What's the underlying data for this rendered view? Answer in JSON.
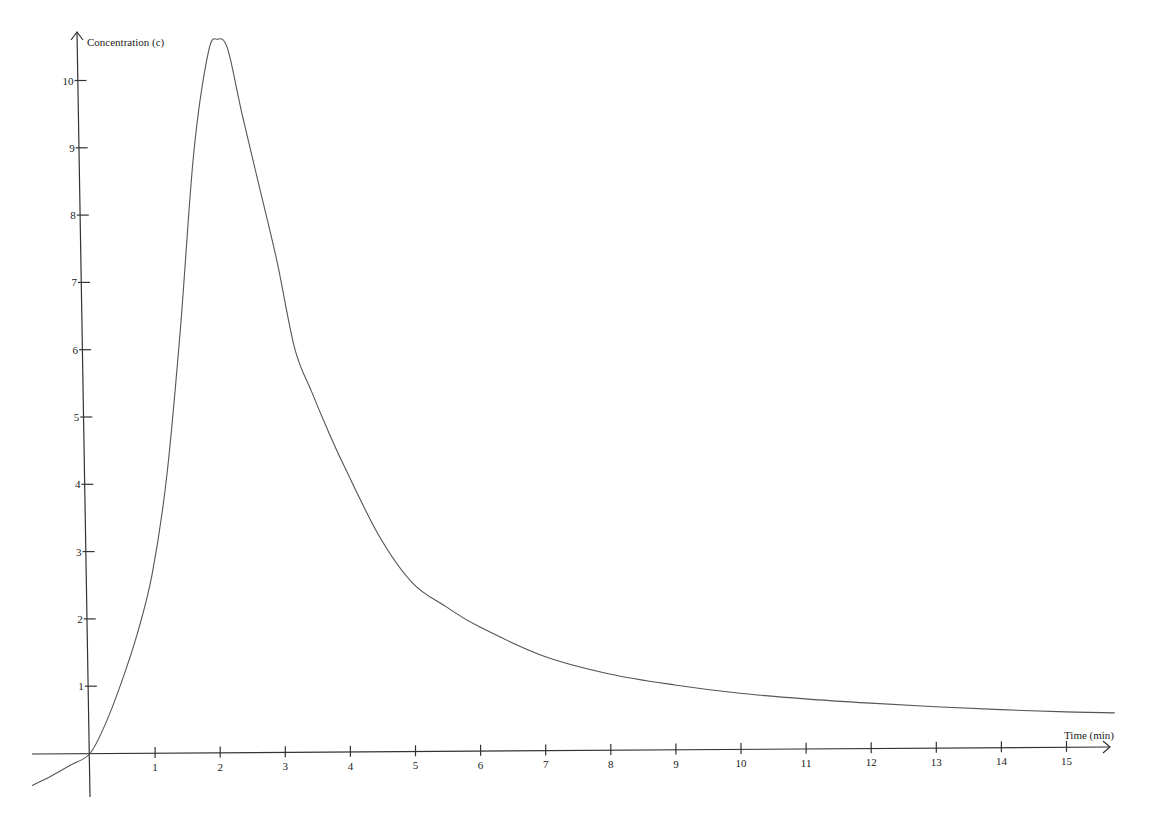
{
  "chart_data": {
    "type": "line",
    "title": "",
    "xlabel": "Time (min)",
    "ylabel": "Concentration (c)",
    "xlim": [
      -0.9,
      15.8
    ],
    "ylim": [
      -0.5,
      10.9
    ],
    "grid": false,
    "legend": "none",
    "x_ticks": [
      1,
      2,
      3,
      4,
      5,
      6,
      7,
      8,
      9,
      10,
      11,
      12,
      13,
      14,
      15
    ],
    "y_ticks": [
      1,
      2,
      3,
      4,
      5,
      6,
      7,
      8,
      9,
      10
    ],
    "series": [
      {
        "name": "c(t)",
        "x": [
          -0.9,
          -0.6,
          -0.3,
          0,
          0.25,
          0.5,
          0.75,
          1.0,
          1.25,
          1.5,
          1.75,
          2.0,
          2.15,
          2.3,
          2.5,
          2.75,
          3.0,
          3.25,
          3.5,
          3.75,
          4.0,
          4.5,
          5.0,
          5.5,
          6.0,
          7.0,
          8.0,
          9.0,
          10.0,
          11.0,
          12.0,
          13.0,
          14.0,
          15.0,
          15.75
        ],
        "values": [
          -0.47,
          -0.33,
          -0.17,
          0,
          0.45,
          1.05,
          1.75,
          2.65,
          4.1,
          6.3,
          8.9,
          10.4,
          10.6,
          10.45,
          9.5,
          8.4,
          7.3,
          6.0,
          5.35,
          4.75,
          4.2,
          3.2,
          2.5,
          2.15,
          1.85,
          1.4,
          1.13,
          0.96,
          0.83,
          0.74,
          0.67,
          0.61,
          0.56,
          0.52,
          0.5
        ]
      }
    ]
  }
}
